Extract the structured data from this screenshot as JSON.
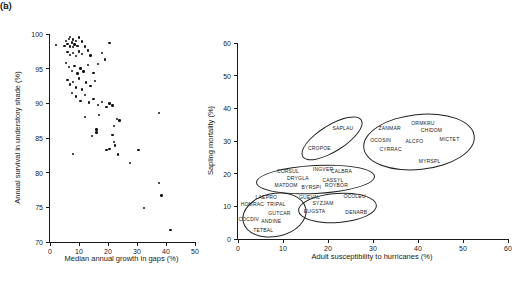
{
  "colors": {
    "ink": "#1a1a1a",
    "background": "#ffffff"
  },
  "panel_a": {
    "letter": "(a)",
    "xlabel": "Median annual growth in gaps (%)",
    "ylabel": "Annual survival in understory shade (%)"
  },
  "panel_b": {
    "letter": "(b)",
    "xlabel": "Adult susceptibility to hurricanes (%)",
    "ylabel": "Sapling mortality (%)"
  },
  "chart_data": [
    {
      "type": "scatter",
      "panel": "a",
      "title": "",
      "xlabel": "Median annual growth in gaps (%)",
      "ylabel": "Annual survival in understory shade (%)",
      "xlim": [
        0,
        50
      ],
      "ylim": [
        70,
        100
      ],
      "xticks": [
        0,
        10,
        20,
        30,
        40,
        50
      ],
      "yticks": [
        70,
        75,
        80,
        85,
        90,
        95,
        100
      ],
      "grid": false,
      "legend": "none",
      "marker": "small-black-dot",
      "points": [
        [
          2,
          98.4
        ],
        [
          5,
          98.3
        ],
        [
          5.5,
          99
        ],
        [
          6,
          98.6
        ],
        [
          6.5,
          99.3
        ],
        [
          7,
          98.2
        ],
        [
          7,
          99.6
        ],
        [
          7.5,
          98.8
        ],
        [
          8,
          98.1
        ],
        [
          8,
          99.2
        ],
        [
          8.5,
          98.5
        ],
        [
          9,
          99
        ],
        [
          9.5,
          98.3
        ],
        [
          10,
          99.5
        ],
        [
          11,
          98.9
        ],
        [
          12,
          98.2
        ],
        [
          6,
          97.4
        ],
        [
          7,
          97
        ],
        [
          8,
          97.3
        ],
        [
          9,
          96.8
        ],
        [
          10,
          97.5
        ],
        [
          11,
          97.1
        ],
        [
          13,
          97.6
        ],
        [
          14,
          96.9
        ],
        [
          18,
          97.3
        ],
        [
          19,
          96.3
        ],
        [
          20.5,
          98.7
        ],
        [
          5.5,
          95.8
        ],
        [
          6.5,
          95.2
        ],
        [
          7.5,
          94.7
        ],
        [
          8.5,
          95.4
        ],
        [
          9.5,
          94.3
        ],
        [
          10.5,
          95
        ],
        [
          11.5,
          94.6
        ],
        [
          13,
          95.5
        ],
        [
          15,
          94.4
        ],
        [
          16.5,
          95.7
        ],
        [
          6,
          93.4
        ],
        [
          7,
          92.7
        ],
        [
          8,
          93.1
        ],
        [
          9,
          92.3
        ],
        [
          10,
          93.6
        ],
        [
          11,
          92
        ],
        [
          12.5,
          93
        ],
        [
          14,
          92.5
        ],
        [
          15.5,
          93.2
        ],
        [
          7.5,
          91.5
        ],
        [
          9,
          91
        ],
        [
          10.5,
          90.3
        ],
        [
          12,
          91.2
        ],
        [
          13.5,
          90.1
        ],
        [
          15,
          90.6
        ],
        [
          16.5,
          89.8
        ],
        [
          18,
          90.2
        ],
        [
          19.5,
          89.5
        ],
        [
          20.5,
          90
        ],
        [
          21.5,
          89.7
        ],
        [
          12,
          88
        ],
        [
          17,
          88.3
        ],
        [
          22,
          86.7
        ],
        [
          23,
          87.7
        ],
        [
          24,
          87.5
        ],
        [
          37.5,
          88.6
        ],
        [
          14.5,
          85.3
        ],
        [
          16,
          86.2
        ],
        [
          16,
          85.8
        ],
        [
          19.5,
          83.3
        ],
        [
          20.5,
          83.4
        ],
        [
          21.5,
          85.4
        ],
        [
          22,
          84.4
        ],
        [
          22.5,
          83.9
        ],
        [
          23.5,
          82.6
        ],
        [
          30.5,
          83.3
        ],
        [
          8,
          82.7
        ],
        [
          27.5,
          81.4
        ],
        [
          32.5,
          74.9
        ],
        [
          37.5,
          78.5
        ],
        [
          38.5,
          76.7
        ],
        [
          41.5,
          71.7
        ]
      ]
    },
    {
      "type": "scatter",
      "panel": "b",
      "title": "",
      "xlabel": "Adult susceptibility to hurricanes (%)",
      "ylabel": "Sapling mortality (%)",
      "xlim": [
        0,
        60
      ],
      "ylim": [
        0,
        60
      ],
      "xticks": [
        0,
        10,
        20,
        30,
        40,
        50,
        60
      ],
      "yticks": [
        0,
        10,
        20,
        30,
        40,
        50,
        60
      ],
      "grid": false,
      "legend": "none",
      "marker": "text-species-codes",
      "species": [
        {
          "code": "SAPLAU",
          "x": 23.3,
          "y": 34
        },
        {
          "code": "CROPOE",
          "x": 18.1,
          "y": 27.9
        },
        {
          "code": "ZANMAR",
          "x": 33.7,
          "y": 34
        },
        {
          "code": "ORMKRU",
          "x": 41.1,
          "y": 35.5
        },
        {
          "code": "CHIDOM",
          "x": 43,
          "y": 33.3
        },
        {
          "code": "MICTET",
          "x": 47,
          "y": 30.6
        },
        {
          "code": "OCOSIN",
          "x": 31.7,
          "y": 30.4
        },
        {
          "code": "ALCFO",
          "x": 39.2,
          "y": 29.9
        },
        {
          "code": "CYRRAC",
          "x": 33.9,
          "y": 27.6
        },
        {
          "code": "MYRSPL",
          "x": 42.6,
          "y": 23.8
        },
        {
          "code": "CORSUL",
          "x": 11.1,
          "y": 20.9
        },
        {
          "code": "INGVER",
          "x": 18.9,
          "y": 21.5
        },
        {
          "code": "CALBRA",
          "x": 23,
          "y": 20.9
        },
        {
          "code": "DRYGLA",
          "x": 13.3,
          "y": 18.7
        },
        {
          "code": "CASSYL",
          "x": 21.1,
          "y": 18.2
        },
        {
          "code": "MATDOM",
          "x": 10.7,
          "y": 16.5
        },
        {
          "code": "BYRSPI",
          "x": 16.3,
          "y": 15.8
        },
        {
          "code": "ROYBOR",
          "x": 21.9,
          "y": 16.5
        },
        {
          "code": "LAEPRO",
          "x": 6.3,
          "y": 12.9
        },
        {
          "code": "HOMRAC",
          "x": 3.2,
          "y": 10.6
        },
        {
          "code": "TRIPAL",
          "x": 8.5,
          "y": 10.6
        },
        {
          "code": "GUTCAR",
          "x": 9.2,
          "y": 8
        },
        {
          "code": "COCDIV",
          "x": 2.4,
          "y": 6.2
        },
        {
          "code": "ANDINE",
          "x": 7.4,
          "y": 5.4
        },
        {
          "code": "TETBAL",
          "x": 5.6,
          "y": 2.9
        },
        {
          "code": "GUEVAL",
          "x": 15.9,
          "y": 12.9
        },
        {
          "code": "OCOLEU",
          "x": 25.9,
          "y": 13.1
        },
        {
          "code": "SYZJAM",
          "x": 18.9,
          "y": 10.9
        },
        {
          "code": "EUGSTA",
          "x": 17,
          "y": 8.5
        },
        {
          "code": "DENARB",
          "x": 26.3,
          "y": 8.2
        }
      ],
      "groups": [
        {
          "cx": 20.7,
          "cy": 31.2,
          "rx": 7.5,
          "ry": 3.8,
          "rot": -32,
          "members": [
            "SAPLAU",
            "CROPOE"
          ]
        },
        {
          "cx": 40,
          "cy": 30,
          "rx": 12.2,
          "ry": 8.2,
          "rot": -6,
          "members": [
            "ZANMAR",
            "ORMKRU",
            "CHIDOM",
            "MICTET",
            "OCOSIN",
            "ALCFO",
            "CYRRAC",
            "MYRSPL"
          ]
        },
        {
          "cx": 17,
          "cy": 18.6,
          "rx": 13,
          "ry": 4.1,
          "rot": -3,
          "members": [
            "CORSUL",
            "INGVER",
            "CALBRA",
            "DRYGLA",
            "CASSYL",
            "MATDOM",
            "BYRSPI",
            "ROYBOR"
          ]
        },
        {
          "cx": 7.8,
          "cy": 7.6,
          "rx": 7,
          "ry": 6.5,
          "rot": -12,
          "members": [
            "LAEPRO",
            "HOMRAC",
            "TRIPAL",
            "GUTCAR",
            "COCDIV",
            "ANDINE",
            "TETBAL"
          ]
        },
        {
          "cx": 21.8,
          "cy": 9.7,
          "rx": 8.5,
          "ry": 4.3,
          "rot": -4,
          "members": [
            "GUEVAL",
            "OCOLEU",
            "SYZJAM",
            "EUGSTA",
            "DENARB"
          ]
        }
      ]
    }
  ]
}
